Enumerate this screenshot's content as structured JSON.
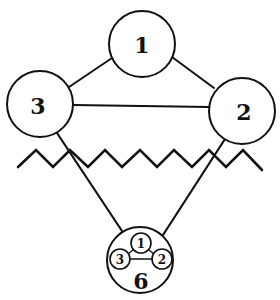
{
  "diagram": {
    "type": "graph-illustration",
    "colors": {
      "line": "#111111",
      "background": "#ffffff"
    },
    "top_group": {
      "nodes": [
        {
          "id": "n1",
          "label": "1",
          "cx": 142,
          "cy": 44,
          "r": 33
        },
        {
          "id": "n2",
          "label": "2",
          "cx": 242,
          "cy": 111,
          "r": 33
        },
        {
          "id": "n3",
          "label": "3",
          "cx": 40,
          "cy": 104,
          "r": 33
        }
      ],
      "edges": [
        {
          "from": "1",
          "to": "3"
        },
        {
          "from": "1",
          "to": "2"
        },
        {
          "from": "3",
          "to": "2"
        }
      ]
    },
    "zigzag": {
      "description": "horizontal zigzag line separating upper and lower parts",
      "points": "18,167 36,150 53,167 70,150 88,167 105,150 122,167 140,150 157,167 174,150 192,167 209,150 226,167 243,150 262,170"
    },
    "bottom_node": {
      "label": "6",
      "cx": 140,
      "cy": 260,
      "r": 33,
      "inner_nodes": [
        {
          "label": "1",
          "cx": 141,
          "cy": 243,
          "r": 10
        },
        {
          "label": "3",
          "cx": 120,
          "cy": 259,
          "r": 10
        },
        {
          "label": "2",
          "cx": 162,
          "cy": 259,
          "r": 10
        }
      ]
    },
    "connectors": [
      {
        "from": "3",
        "to": "6"
      },
      {
        "from": "2",
        "to": "6"
      }
    ]
  }
}
